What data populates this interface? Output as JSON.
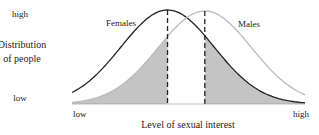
{
  "chart_data": {
    "type": "line",
    "title": "",
    "xlabel": "Level of sexual interest",
    "ylabel": [
      "Distribution",
      "of people"
    ],
    "xtick_labels": {
      "low": "low",
      "high": "high"
    },
    "ytick_labels": {
      "low": "low",
      "high": "high"
    },
    "xlim": [
      0,
      1
    ],
    "ylim": [
      0,
      1
    ],
    "grid": false,
    "series": [
      {
        "name": "Females",
        "mean": 0.41,
        "sd": 0.2,
        "peak": 1.0,
        "color": "#222222"
      },
      {
        "name": "Males",
        "mean": 0.57,
        "sd": 0.2,
        "peak": 0.99,
        "color": "#bbbbbb"
      }
    ],
    "mean_markers": [
      {
        "series": "Females",
        "x": 0.41,
        "style": "dashed"
      },
      {
        "series": "Males",
        "x": 0.57,
        "style": "dashed"
      }
    ],
    "shaded_regions": [
      {
        "under": "Males",
        "from": 0.0,
        "to": 0.41,
        "color": "#c4c4c4"
      },
      {
        "under": "Females",
        "from": 0.57,
        "to": 1.0,
        "color": "#c4c4c4"
      }
    ],
    "series_labels": {
      "Females": "Females",
      "Males": "Males"
    }
  }
}
